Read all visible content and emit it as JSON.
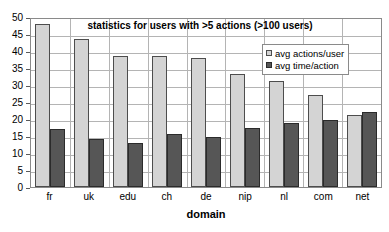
{
  "chart_data": {
    "type": "bar",
    "title": "statistics for users with >5 actions (>100 users)",
    "xlabel": "domain",
    "ylabel": "",
    "categories": [
      "fr",
      "uk",
      "edu",
      "ch",
      "de",
      "nip",
      "nl",
      "com",
      "net"
    ],
    "series": [
      {
        "name": "avg actions/user",
        "color": "#d4d4d4",
        "values": [
          48.0,
          43.5,
          38.5,
          38.5,
          38.0,
          33.3,
          31.3,
          27.0,
          21.3
        ]
      },
      {
        "name": "avg time/action",
        "color": "#565656",
        "values": [
          17.0,
          14.0,
          13.0,
          15.5,
          14.7,
          17.5,
          18.7,
          19.7,
          22.0
        ]
      }
    ],
    "ylim": [
      0,
      50
    ],
    "ytick_step": 5,
    "yticks": [
      50,
      45,
      40,
      35,
      30,
      25,
      20,
      15,
      10,
      5,
      0
    ],
    "grid": true,
    "legend_position": "top-right",
    "legend_entries": [
      "avg actions/user",
      "avg time/action"
    ]
  }
}
